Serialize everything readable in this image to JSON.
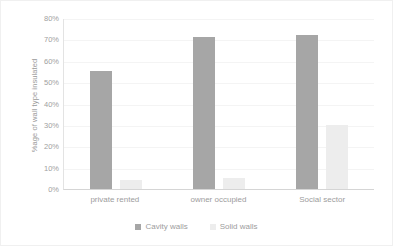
{
  "chart_data": {
    "type": "bar",
    "title": "",
    "subtitle": "",
    "xlabel": "",
    "ylabel": "%age of wall type insulated",
    "categories": [
      "private rented",
      "owner occupied",
      "Social sector"
    ],
    "series": [
      {
        "name": "Cavity walls",
        "values": [
          55,
          71,
          72
        ],
        "color": "#a6a6a6"
      },
      {
        "name": "Solid walls",
        "values": [
          4,
          5,
          30
        ],
        "color": "#ededed"
      }
    ],
    "ylim": [
      0,
      80
    ],
    "y_tick_labels": [
      "80%",
      "70%",
      "60%",
      "50%",
      "40%",
      "30%",
      "20%",
      "10%",
      "0%"
    ],
    "y_tick_values": [
      80,
      70,
      60,
      50,
      40,
      30,
      20,
      10,
      0
    ],
    "grid": true,
    "legend_position": "bottom",
    "annotations": []
  },
  "legend": {
    "entries": [
      {
        "label": "Cavity walls",
        "color": "#a6a6a6"
      },
      {
        "label": "Solid walls",
        "color": "#ededed"
      }
    ]
  },
  "colors": {
    "cavity_walls": "#a6a6a6",
    "solid_walls": "#ededed",
    "gridline": "#f4f4f4",
    "axis": "#d5d5d5",
    "tick_text": "#a0a0a0",
    "background": "#ffffff"
  }
}
